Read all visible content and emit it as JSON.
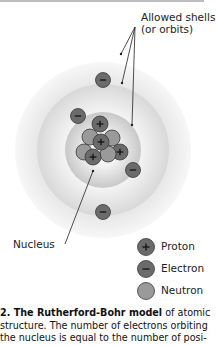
{
  "labels": {
    "shells_line1": "Allowed shells",
    "shells_line2": "(or orbits)",
    "nucleus": "Nucleus"
  },
  "particle_symbols": {
    "proton": "+",
    "electron": "–"
  },
  "legend": [
    {
      "name": "Proton",
      "symbol": "+"
    },
    {
      "name": "Electron",
      "symbol": "–"
    },
    {
      "name": "Neutron",
      "symbol": ""
    }
  ],
  "caption": {
    "bold": "2. The Rutherford-Bohr model",
    "line1_rest": " of atomic",
    "line2": "structure. The number of electrons orbiting",
    "line3": "the nucleus is equal to the number of posi-"
  },
  "colors": {
    "particle_fill": "#6b6b6b",
    "neutron_fill": "#9a9a9a",
    "particle_stroke": "#3a3a3a",
    "shell_outer": "#e9e9e9",
    "shell_middle": "#dcdcdc",
    "shell_inner": "#cfcfcf"
  },
  "atom": {
    "shell_count": 3,
    "electron_count": 4,
    "proton_count": 4
  }
}
